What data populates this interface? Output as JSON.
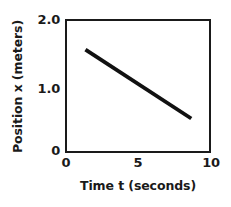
{
  "chart_data": {
    "type": "line",
    "title": "",
    "subtitle": "",
    "xlabel": "Time t (seconds)",
    "ylabel": "Position x (meters)",
    "xlim": [
      0,
      10
    ],
    "ylim": [
      0,
      2.0
    ],
    "xticks": [
      0,
      5,
      10
    ],
    "xticklabels": [
      "0",
      "5",
      "10"
    ],
    "yticks": [
      0,
      1.0,
      2.0
    ],
    "yticklabels": [
      "0",
      "1.0",
      "2.0"
    ],
    "grid": false,
    "legend": null,
    "legend_position": "none",
    "annotations": [],
    "series": [
      {
        "name": "position vs time",
        "color": "#111111",
        "linewidth": 4,
        "x": [
          1.3,
          8.75
        ],
        "y": [
          1.56,
          0.5
        ],
        "slope": -0.142,
        "intercept": 1.745
      }
    ]
  },
  "axes": {
    "y_tick_2": "2.0",
    "y_tick_1": "1.0",
    "y_tick_0": "0",
    "x_tick_0": "0",
    "x_tick_5": "5",
    "x_tick_10": "10",
    "x_axis_title": "Time t (seconds)",
    "y_axis_title": "Position x (meters)"
  },
  "colors": {
    "background": "#ffffff",
    "axis": "#1a1a1a",
    "data_line": "#111111",
    "text": "#1a1a1a"
  }
}
